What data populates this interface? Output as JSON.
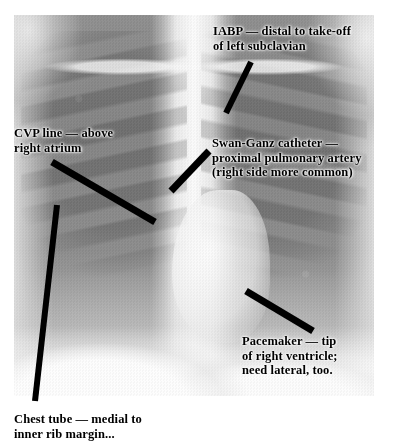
{
  "figure": {
    "type": "chest-radiograph",
    "modality_label": "Chest X-ray (AP/PA)",
    "alt": "Frontal chest radiograph with five black leader lines pointing to indwelling support devices"
  },
  "annotations": [
    {
      "id": "iabp",
      "name": "iabp",
      "text": "IABP — distal to take-off\nof left subclavian",
      "text_color": "#000000",
      "halo_color": "#ffffff",
      "placement": "on-film",
      "leader": {
        "x1": 251,
        "y1": 62,
        "x2": 226,
        "y2": 113,
        "width": 6,
        "color": "#000000"
      }
    },
    {
      "id": "cvp",
      "name": "cvp-line",
      "text": "CVP line — above\nright atrium",
      "text_color": "#000000",
      "halo_color": "#ffffff",
      "placement": "on-film",
      "leader": {
        "x1": 52,
        "y1": 162,
        "x2": 155,
        "y2": 222,
        "width": 7,
        "color": "#000000"
      }
    },
    {
      "id": "swanganz",
      "name": "swan-ganz-catheter",
      "text": "Swan-Ganz catheter —\nproximal pulmonary artery\n(right side more common)",
      "text_color": "#000000",
      "halo_color": "#ffffff",
      "placement": "on-film",
      "leader": {
        "x1": 209,
        "y1": 151,
        "x2": 171,
        "y2": 191,
        "width": 7,
        "color": "#000000"
      }
    },
    {
      "id": "pacemaker",
      "name": "pacemaker",
      "text": "Pacemaker — tip\nof right ventricle;\nneed lateral, too.",
      "text_color": "#000000",
      "halo_color": "#ffffff",
      "placement": "on-film",
      "leader": {
        "x1": 246,
        "y1": 291,
        "x2": 313,
        "y2": 331,
        "width": 7,
        "color": "#000000"
      }
    },
    {
      "id": "chesttube",
      "name": "chest-tube",
      "text": "Chest tube — medial to\ninner rib margin...",
      "text_color": "#000000",
      "halo_color": "#ffffff",
      "placement": "off-film",
      "leader": {
        "x1": 57,
        "y1": 205,
        "x2": 35,
        "y2": 401,
        "width": 6,
        "color": "#000000"
      }
    }
  ],
  "canvas": {
    "width": 393,
    "height": 447,
    "background": "#ffffff",
    "film_rect": {
      "left": 14,
      "top": 15,
      "width": 360,
      "height": 381
    }
  }
}
